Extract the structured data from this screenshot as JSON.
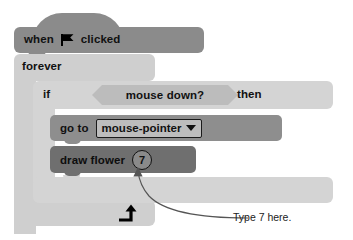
{
  "canvas": {
    "width": 353,
    "height": 240,
    "background": "#ffffff"
  },
  "palette": {
    "hat_block": "#8b8b8b",
    "forever_block": "#cfcfcf",
    "if_block": "#d4d4d4",
    "boolean_hex": "#bcbcbc",
    "goto_block": "#8e8e8e",
    "draw_block": "#6f6f6f",
    "dropdown_fill": "#bdbdbd",
    "input_fill": "#8a8a8a",
    "outline": "#111111",
    "text": "#111111",
    "annotation_text": "#222222"
  },
  "script": {
    "hat": {
      "word_when": "when",
      "icon": "green-flag-icon",
      "word_clicked": "clicked"
    },
    "forever": {
      "label": "forever",
      "loop_icon": "loop-arrow-icon"
    },
    "if_block": {
      "label_if": "if",
      "label_then": "then",
      "condition": {
        "label": "mouse down?",
        "shape": "hexagon-boolean"
      }
    },
    "goto_block": {
      "label": "go to",
      "dropdown": {
        "value": "mouse-pointer",
        "caret_icon": "chevron-down-icon",
        "options": [
          "mouse-pointer"
        ]
      }
    },
    "draw_block": {
      "label": "draw flower",
      "input_value": "7"
    }
  },
  "annotation": {
    "text": "Type 7 here.",
    "arrow_icon": "curved-arrow-icon",
    "points_to": "draw-flower-number-input"
  }
}
